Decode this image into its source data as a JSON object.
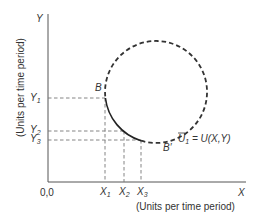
{
  "diagram": {
    "y_axis_letter": "Y",
    "x_axis_letter": "X",
    "y_axis_label": "(Units per time period)",
    "x_axis_label": "(Units per time period)",
    "origin_label": "0,0",
    "points": {
      "B": "B",
      "B_prime": "B′"
    },
    "y_ticks": [
      {
        "base": "Y",
        "sub": "1"
      },
      {
        "base": "Y",
        "sub": "2"
      },
      {
        "base": "Y",
        "sub": "3"
      }
    ],
    "x_ticks": [
      {
        "base": "X",
        "sub": "1"
      },
      {
        "base": "X",
        "sub": "2"
      },
      {
        "base": "X",
        "sub": "3"
      }
    ],
    "curve_label": {
      "base": "U",
      "sub": "1",
      "rhs": " = U(X,Y)"
    },
    "colors": {
      "axis": "#555555",
      "curve": "#222222",
      "guide": "#777777",
      "text": "#333333"
    }
  }
}
